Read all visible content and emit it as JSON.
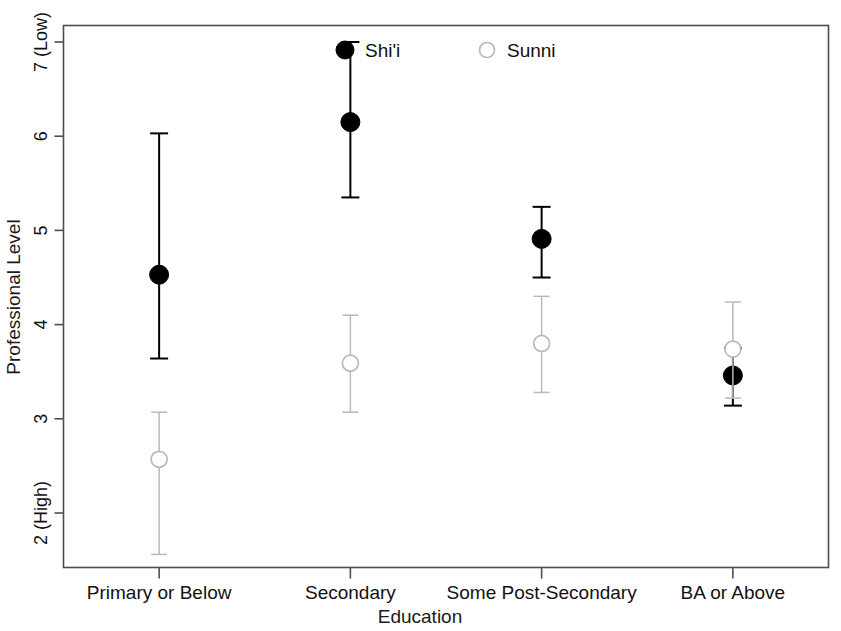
{
  "chart_data": {
    "type": "scatter",
    "title": "",
    "xlabel": "Education",
    "ylabel": "Professional Level",
    "categories": [
      "Primary or Below",
      "Secondary",
      "Some Post-Secondary",
      "BA or Above"
    ],
    "ylim": [
      1.5,
      7.3
    ],
    "yticks": [
      2,
      3,
      4,
      5,
      6,
      7
    ],
    "ytick_labels": [
      "2 (High)",
      "3",
      "4",
      "5",
      "6",
      "7 (Low)"
    ],
    "y_axis_direction": "inverted-meaning (7 = Low, 2 = High)",
    "grid": false,
    "legend_position": "top-center",
    "legend": [
      {
        "name": "Shi'i",
        "marker": "filled-circle",
        "color": "#000000"
      },
      {
        "name": "Sunni",
        "marker": "open-circle",
        "color": "#b9b9b9"
      }
    ],
    "series": [
      {
        "name": "Shi'i",
        "marker": "filled-circle",
        "color": "#000000",
        "values": [
          4.53,
          6.15,
          4.91,
          3.46
        ],
        "ci_low": [
          3.64,
          5.35,
          4.5,
          3.14
        ],
        "ci_high": [
          6.03,
          7.0,
          5.25,
          3.75
        ]
      },
      {
        "name": "Sunni",
        "marker": "open-circle",
        "color": "#b9b9b9",
        "values": [
          2.57,
          3.59,
          3.8,
          3.74
        ],
        "ci_low": [
          1.56,
          3.07,
          3.28,
          3.22
        ],
        "ci_high": [
          3.07,
          4.1,
          4.3,
          4.24
        ]
      }
    ]
  },
  "axes": {
    "ylabel": "Professional Level",
    "xlabel": "Education"
  },
  "colors": {
    "shii": "#000000",
    "sunni": "#b9b9b9",
    "frame": "#4d4d4d",
    "text": "#111111",
    "background": "#ffffff"
  }
}
